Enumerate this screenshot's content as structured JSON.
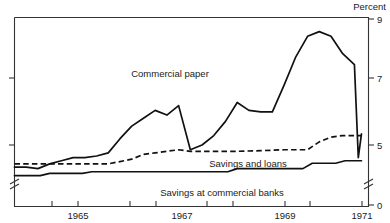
{
  "chart_data": {
    "type": "line",
    "title": "",
    "ylabel": "Percent",
    "xlabel": "",
    "ylim": [
      0,
      9
    ],
    "y_ticks": [
      0,
      5,
      7,
      9
    ],
    "y_tick_labels": [
      "0",
      "5",
      "7",
      "9"
    ],
    "axis_break": true,
    "axis_break_note": "y-axis broken between 0 and about 4",
    "grid": false,
    "legend": "inline-labels",
    "x_ticks": [
      1964,
      1965,
      1966,
      1967,
      1968,
      1969,
      1970,
      1971
    ],
    "x_tick_labels": [
      "",
      "1965",
      "",
      "1967",
      "",
      "1969",
      "",
      "1971"
    ],
    "xlim": [
      1963.75,
      1971.3
    ],
    "series": [
      {
        "name": "Commercial paper",
        "style": "solid",
        "label_x": 1967.1,
        "label_y": 7.6,
        "x": [
          1963.75,
          1964.0,
          1964.25,
          1964.5,
          1964.75,
          1965.0,
          1965.25,
          1965.5,
          1965.75,
          1966.0,
          1966.25,
          1966.5,
          1966.75,
          1967.0,
          1967.25,
          1967.5,
          1967.75,
          1968.0,
          1968.25,
          1968.5,
          1968.75,
          1969.0,
          1969.25,
          1969.5,
          1969.75,
          1970.0,
          1970.25,
          1970.5,
          1970.75,
          1971.0,
          1971.15
        ],
        "values": [
          4.3,
          4.3,
          4.25,
          4.4,
          4.5,
          4.6,
          4.6,
          4.65,
          4.75,
          5.2,
          5.6,
          5.85,
          6.1,
          5.95,
          6.25,
          4.85,
          5.0,
          5.3,
          5.75,
          6.35,
          6.1,
          6.05,
          6.05,
          6.9,
          7.8,
          8.45,
          8.6,
          8.45,
          7.9,
          7.55,
          5.35
        ],
        "v_bottom": 4.6
      },
      {
        "name": "Savings and loans",
        "style": "dashed",
        "label_x": 1968.0,
        "label_y": 4.45,
        "x": [
          1963.75,
          1964.25,
          1964.75,
          1965.25,
          1965.75,
          1966.25,
          1966.5,
          1966.75,
          1967.0,
          1967.25,
          1967.5,
          1967.75,
          1968.0,
          1968.5,
          1969.0,
          1969.5,
          1969.75,
          1970.0,
          1970.25,
          1970.5,
          1970.75,
          1971.0,
          1971.15
        ],
        "values": [
          4.4,
          4.4,
          4.4,
          4.4,
          4.4,
          4.55,
          4.7,
          4.75,
          4.8,
          4.85,
          4.8,
          4.8,
          4.8,
          4.8,
          4.82,
          4.85,
          4.85,
          4.85,
          5.1,
          5.25,
          5.3,
          5.3,
          5.3
        ]
      },
      {
        "name": "Savings at commercial banks",
        "style": "solid",
        "label_x": 1967.5,
        "label_y": 3.75,
        "x": [
          1963.75,
          1964.3,
          1964.5,
          1965.2,
          1965.4,
          1968.3,
          1968.5,
          1969.9,
          1970.1,
          1970.6,
          1970.8,
          1971.15
        ],
        "values": [
          4.03,
          4.03,
          4.1,
          4.1,
          4.15,
          4.15,
          4.25,
          4.25,
          4.42,
          4.42,
          4.5,
          4.5
        ]
      }
    ]
  },
  "labels": {
    "percent": "Percent",
    "commercial_paper": "Commercial paper",
    "savings_and_loans": "Savings and loans",
    "savings_commercial_banks": "Savings at commercial banks"
  },
  "axis": {
    "y_9": "9",
    "y_7": "7",
    "y_5": "5",
    "y_0": "0",
    "x_1965": "1965",
    "x_1967": "1967",
    "x_1969": "1969",
    "x_1971": "1971"
  }
}
